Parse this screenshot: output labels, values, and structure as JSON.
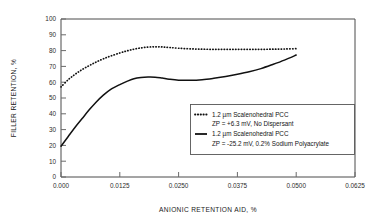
{
  "chart_data": {
    "type": "line",
    "title": "",
    "xlabel": "ANIONIC RETENTION AID, %",
    "ylabel": "FILLER RETENTION, %",
    "xlim": [
      0.0,
      0.0625
    ],
    "ylim": [
      0,
      100
    ],
    "grid": false,
    "legend_position": "inside-lower-right",
    "xticks": [
      0.0,
      0.0125,
      0.025,
      0.0375,
      0.05,
      0.0625
    ],
    "xtick_labels": [
      "0.000",
      "0.0125",
      "0.0250",
      "0.0375",
      "0.0500",
      "0.0625"
    ],
    "yticks": [
      0,
      10,
      20,
      30,
      40,
      50,
      60,
      70,
      80,
      90,
      100
    ],
    "ytick_labels": [
      "0",
      "10",
      "20",
      "30",
      "40",
      "50",
      "60",
      "70",
      "80",
      "90",
      "100"
    ],
    "series": [
      {
        "name": "1.2 µm Scalenohedral PCC, ZP = +6.3 mV, No Dispersant",
        "style": "dotted",
        "color": "#111111",
        "x": [
          0.0,
          0.0015,
          0.003,
          0.0045,
          0.006,
          0.0075,
          0.009,
          0.0105,
          0.0125,
          0.014,
          0.0155,
          0.017,
          0.0185,
          0.02,
          0.0215,
          0.023,
          0.025,
          0.0275,
          0.03,
          0.0325,
          0.035,
          0.0375,
          0.04,
          0.0425,
          0.045,
          0.0475,
          0.05
        ],
        "y": [
          57.0,
          61.5,
          65.0,
          68.0,
          70.5,
          72.8,
          74.8,
          76.5,
          78.5,
          79.8,
          80.9,
          81.7,
          82.2,
          82.4,
          82.3,
          82.0,
          81.5,
          81.1,
          80.9,
          80.8,
          80.8,
          80.8,
          80.8,
          80.8,
          80.9,
          81.0,
          81.2
        ]
      },
      {
        "name": "1.2 µm Scalenohedral PCC, ZP = -25.2 mV, 0.2% Sodium Polyacrylate",
        "style": "solid",
        "color": "#111111",
        "x": [
          0.0,
          0.0015,
          0.003,
          0.0045,
          0.006,
          0.0075,
          0.009,
          0.0105,
          0.0125,
          0.014,
          0.0155,
          0.017,
          0.0185,
          0.02,
          0.0215,
          0.023,
          0.025,
          0.0275,
          0.03,
          0.0325,
          0.035,
          0.0375,
          0.04,
          0.0425,
          0.045,
          0.0475,
          0.05
        ],
        "y": [
          19.5,
          25.5,
          31.5,
          37.0,
          42.5,
          47.5,
          51.8,
          55.3,
          58.5,
          60.5,
          62.2,
          63.0,
          63.3,
          63.2,
          62.6,
          61.9,
          61.3,
          61.2,
          61.6,
          62.5,
          63.6,
          65.0,
          66.6,
          68.6,
          71.2,
          74.0,
          77.2
        ]
      }
    ]
  },
  "legend": {
    "entries": [
      {
        "marker": "dotted-line-sample",
        "line1": "1.2 µm Scalenohedral PCC",
        "line2": "ZP = +6.3 mV, No Dispersant"
      },
      {
        "marker": "solid-line-sample",
        "line1": "1.2 µm Scalenohedral PCC",
        "line2": "ZP = -25.2 mV, 0.2% Sodium Polyacrylate"
      }
    ]
  },
  "colors": {
    "series": "#111111",
    "axis": "#4a4a4a",
    "text": "#1a1a1a",
    "background": "#ffffff"
  }
}
